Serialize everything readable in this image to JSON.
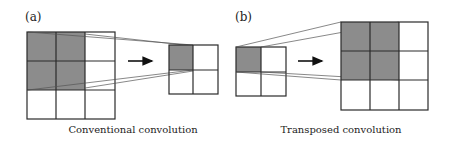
{
  "panels": [
    {
      "label": "(a)",
      "caption": "Conventional convolution",
      "input_grid": {
        "rows": 3,
        "cols": 3,
        "shaded": "2x2 top-left"
      },
      "output_grid": {
        "rows": 2,
        "cols": 2,
        "shaded": "1x1 top-left"
      }
    },
    {
      "label": "(b)",
      "caption": "Transposed convolution",
      "input_grid": {
        "rows": 2,
        "cols": 2,
        "shaded": "1x1 top-left"
      },
      "output_grid": {
        "rows": 3,
        "cols": 3,
        "shaded": "2x2 top-left"
      }
    }
  ],
  "colors": {
    "shade": "#8c8c8c",
    "line": "#2a2a2a",
    "projection": "#555555"
  }
}
